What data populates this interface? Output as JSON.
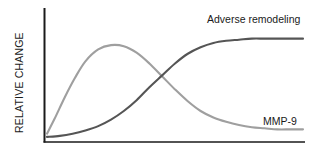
{
  "chart_data": {
    "type": "line",
    "title": "",
    "subtitle": "",
    "xlabel": "",
    "ylabel": "RELATIVE CHANGE",
    "xlim": [
      0,
      100
    ],
    "ylim": [
      0,
      100
    ],
    "grid": false,
    "legend_position": "inline-end-of-curve",
    "axis_ticks": {
      "x": [],
      "y": []
    },
    "annotations": [],
    "series": [
      {
        "name": "MMP-9",
        "label": "MMP-9",
        "color": "#9f9f9f",
        "label_x": 93,
        "label_y": 19,
        "x": [
          0,
          3,
          7,
          11,
          15,
          20,
          25,
          30,
          35,
          40,
          45,
          50,
          55,
          60,
          65,
          70,
          75,
          80,
          85,
          90,
          95,
          100
        ],
        "values": [
          4,
          18,
          38,
          56,
          71,
          82,
          86,
          85,
          79,
          69,
          57,
          45,
          34,
          25,
          19,
          15,
          12,
          10,
          9,
          8,
          8,
          8
        ]
      },
      {
        "name": "Adverse remodeling",
        "label": "Adverse remodeling",
        "color": "#555555",
        "label_x": 62,
        "label_y": 91,
        "x": [
          0,
          5,
          10,
          15,
          20,
          25,
          30,
          35,
          40,
          45,
          50,
          55,
          60,
          65,
          70,
          75,
          80,
          85,
          90,
          95,
          100
        ],
        "values": [
          1,
          2,
          4,
          7,
          11,
          17,
          25,
          35,
          47,
          58,
          69,
          78,
          84,
          88,
          90,
          91,
          92,
          92,
          92,
          92,
          92
        ]
      }
    ]
  },
  "axes": {
    "y_axis_label": "RELATIVE CHANGE",
    "x_axis_label": "",
    "axis_color": "#1a1a1a"
  }
}
